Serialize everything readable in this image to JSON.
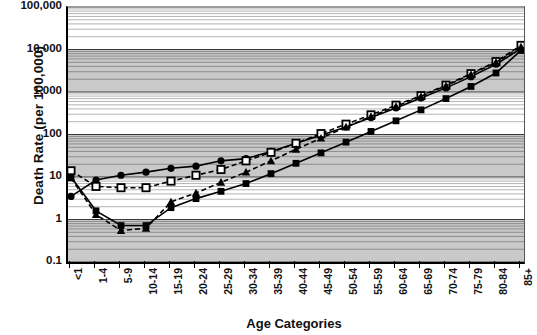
{
  "chart_data": {
    "type": "line",
    "title": "",
    "xlabel": "Age Categories",
    "ylabel": "Death Rate (per 100,000)",
    "yscale": "log",
    "ylim": [
      0.1,
      100000
    ],
    "ytick_labels": [
      "100,000",
      "10,000",
      "1,000",
      "100",
      "10",
      "1",
      "0.1"
    ],
    "ytick_values": [
      100000,
      10000,
      1000,
      100,
      10,
      1,
      0.1
    ],
    "grid": true,
    "grid_style": "alternating-shaded-decades-with-minor-log-lines",
    "legend_position": "none",
    "categories": [
      "<1",
      "1-4",
      "5-9",
      "10-14",
      "15-19",
      "20-24",
      "25-29",
      "30-34",
      "35-39",
      "40-44",
      "45-49",
      "50-54",
      "55-59",
      "60-64",
      "65-69",
      "70-74",
      "75-79",
      "80-84",
      "85+"
    ],
    "series": [
      {
        "name": "series-circle-solid",
        "marker": "filled-circle",
        "line": "solid",
        "color": "#000000",
        "values": [
          3.5,
          8.5,
          11.0,
          13.0,
          16.0,
          18.0,
          24.0,
          27.0,
          40.0,
          62.0,
          96.0,
          150.0,
          250.0,
          420.0,
          720.0,
          1250.0,
          2300.0,
          4500.0,
          10500.0
        ]
      },
      {
        "name": "series-square-open-dashed",
        "marker": "open-square",
        "line": "dashed",
        "color": "#000000",
        "values": [
          14.0,
          6.0,
          5.6,
          5.6,
          8.0,
          11.0,
          15.0,
          24.0,
          38.0,
          62.0,
          105.0,
          175.0,
          290.0,
          490.0,
          820.0,
          1450.0,
          2700.0,
          5200.0,
          12500.0
        ]
      },
      {
        "name": "series-triangle-dashed",
        "marker": "filled-triangle",
        "line": "dashed",
        "color": "#000000",
        "values": [
          9.5,
          1.3,
          0.55,
          0.62,
          2.6,
          4.2,
          7.5,
          13.0,
          24.0,
          45.0,
          82.0,
          150.0,
          265.0,
          460.0,
          790.0,
          1400.0,
          2600.0,
          5000.0,
          11500.0
        ]
      },
      {
        "name": "series-square-filled-solid",
        "marker": "filled-square",
        "line": "solid",
        "color": "#000000",
        "values": [
          10.0,
          1.6,
          0.72,
          0.72,
          1.9,
          3.1,
          4.6,
          7.0,
          12.0,
          21.0,
          37.0,
          66.0,
          118.0,
          210.0,
          380.0,
          700.0,
          1350.0,
          2800.0,
          9500.0
        ]
      }
    ]
  }
}
